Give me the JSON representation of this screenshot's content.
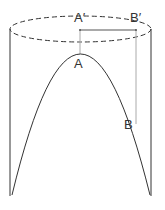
{
  "diagram": {
    "type": "geometry-figure",
    "labels": {
      "a_prime": "A′",
      "b_prime": "B′",
      "a": "A",
      "b": "B"
    },
    "colors": {
      "stroke": "#333333",
      "guide": "#aaaaaa",
      "background": "#ffffff"
    }
  }
}
